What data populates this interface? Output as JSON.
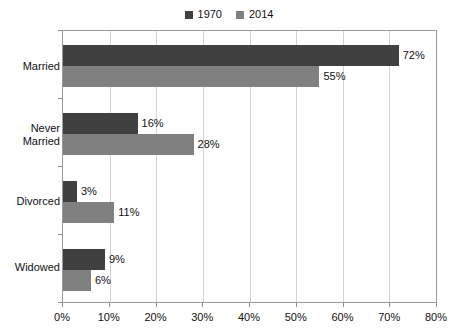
{
  "chart_data": {
    "type": "bar",
    "orientation": "horizontal",
    "title": "",
    "subtitle": "",
    "xlabel": "",
    "ylabel": "",
    "categories": [
      "Married",
      "Never Married",
      "Divorced",
      "Widowed"
    ],
    "series": [
      {
        "name": "1970",
        "color": "#404040",
        "values": [
          72,
          16,
          3,
          9
        ],
        "labels": [
          "72%",
          "16%",
          "3%",
          "9%"
        ]
      },
      {
        "name": "2014",
        "color": "#808080",
        "values": [
          55,
          28,
          11,
          6
        ],
        "labels": [
          "55%",
          "28%",
          "11%",
          "6%"
        ]
      }
    ],
    "xlim": [
      0,
      80
    ],
    "xticks": [
      0,
      10,
      20,
      30,
      40,
      50,
      60,
      70,
      80
    ],
    "xtick_labels": [
      "0%",
      "10%",
      "20%",
      "30%",
      "40%",
      "50%",
      "60%",
      "70%",
      "80%"
    ],
    "grid": true,
    "grid_axis": "x",
    "legend_position": "top-center"
  },
  "legend": {
    "entries": [
      {
        "label": "1970",
        "color": "#404040"
      },
      {
        "label": "2014",
        "color": "#808080"
      }
    ]
  },
  "categories": {
    "married": {
      "label": "Married"
    },
    "never_married": {
      "label_line1": "Never",
      "label_line2": "Married"
    },
    "divorced": {
      "label": "Divorced"
    },
    "widowed": {
      "label": "Widowed"
    }
  },
  "bars": {
    "married_1970": {
      "label": "72%"
    },
    "married_2014": {
      "label": "55%"
    },
    "never_married_1970": {
      "label": "16%"
    },
    "never_married_2014": {
      "label": "28%"
    },
    "divorced_1970": {
      "label": "3%"
    },
    "divorced_2014": {
      "label": "11%"
    },
    "widowed_1970": {
      "label": "9%"
    },
    "widowed_2014": {
      "label": "6%"
    }
  },
  "xaxis": {
    "t0": "0%",
    "t1": "10%",
    "t2": "20%",
    "t3": "30%",
    "t4": "40%",
    "t5": "50%",
    "t6": "60%",
    "t7": "70%",
    "t8": "80%"
  },
  "colors": {
    "series_1970": "#404040",
    "series_2014": "#808080",
    "gridline": "#d2d2d2",
    "axis": "#9a9a9a",
    "text": "#111111"
  }
}
